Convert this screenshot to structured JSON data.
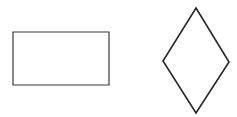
{
  "canvas": {
    "width": 237,
    "height": 117,
    "background_color": "#ffffff",
    "label": "geometric-shapes-canvas"
  },
  "shapes": [
    {
      "id": "rectangle",
      "name": "rectangle",
      "kind": "rectangle",
      "stroke_color": "#3a3a3a",
      "fill_color": "none",
      "stroke_width": 1.2,
      "x": 13,
      "y": 32,
      "width": 96,
      "height": 53,
      "center_x": 61,
      "center_y": 58.5,
      "points": "13,32 109,32 109,85 13,85"
    },
    {
      "id": "diamond",
      "name": "diamond",
      "kind": "rhombus",
      "stroke_color": "#262626",
      "fill_color": "none",
      "stroke_width": 1.6,
      "x": 163,
      "y": 8,
      "width": 66,
      "height": 105,
      "center_x": 196,
      "center_y": 60.5,
      "points": "196,8 229,62 196,113 163,61",
      "vertices": {
        "top": [
          196,
          8
        ],
        "right": [
          229,
          62
        ],
        "bottom": [
          196,
          113
        ],
        "left": [
          163,
          61
        ]
      }
    }
  ]
}
